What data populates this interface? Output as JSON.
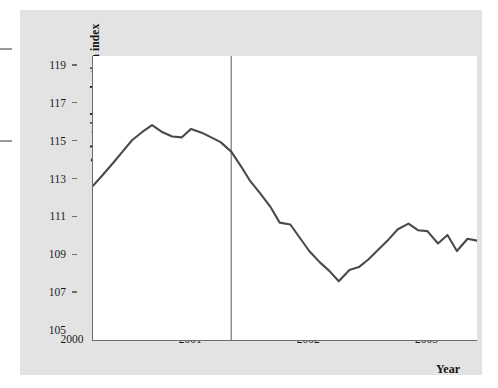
{
  "figure": {
    "background_color": "#e3e3e3",
    "plot_background_color": "#ffffff",
    "axis_color": "#6d6d6d",
    "line_color": "#4a4a4a",
    "marker_line_color": "#808080"
  },
  "axes": {
    "y_title_main": "Industrial production index",
    "y_title_sub": "(1996 = 100)",
    "x_title": "Year"
  },
  "annotations": {
    "series_label": "INDUSTRIAL\nPRODUCTION\nINDEX"
  },
  "chart_data": {
    "type": "line",
    "title": "",
    "subtitle": "",
    "xlabel": "Year",
    "ylabel": "Industrial production index (1996 = 100)",
    "xlim": [
      2000.0,
      2003.25
    ],
    "ylim": [
      105,
      120
    ],
    "yticks": [
      105,
      107,
      109,
      111,
      113,
      115,
      117,
      119
    ],
    "xticks": [
      2000,
      2001,
      2002,
      2003
    ],
    "xticklabels": [
      "2000",
      "2001",
      "2002",
      "2003"
    ],
    "yticklabels": [
      "105",
      "107",
      "109",
      "111",
      "113",
      "115",
      "117",
      "119"
    ],
    "grid": false,
    "legend": "none",
    "series": [
      {
        "name": "INDUSTRIAL PRODUCTION INDEX",
        "color": "#4a4a4a",
        "x": [
          2000.0,
          2000.08,
          2000.17,
          2000.25,
          2000.33,
          2000.42,
          2000.5,
          2000.58,
          2000.67,
          2000.75,
          2000.83,
          2000.92,
          2001.0,
          2001.08,
          2001.17,
          2001.25,
          2001.33,
          2001.42,
          2001.5,
          2001.58,
          2001.67,
          2001.75,
          2001.83,
          2001.92,
          2002.0,
          2002.08,
          2002.17,
          2002.25,
          2002.33,
          2002.42,
          2002.5,
          2002.58,
          2002.67,
          2002.75,
          2002.83,
          2002.92,
          2003.0,
          2003.08,
          2003.17,
          2003.25
        ],
        "y": [
          113.15,
          113.7,
          114.35,
          114.95,
          115.55,
          116.0,
          116.35,
          116.0,
          115.75,
          115.7,
          116.15,
          115.95,
          115.7,
          115.45,
          114.95,
          114.2,
          113.4,
          112.7,
          112.05,
          111.2,
          111.1,
          110.4,
          109.7,
          109.1,
          108.65,
          108.1,
          108.7,
          108.85,
          109.25,
          109.8,
          110.3,
          110.85,
          111.15,
          110.8,
          110.75,
          110.1,
          110.55,
          109.7,
          110.35,
          110.25
        ]
      }
    ],
    "vertical_markers": [
      {
        "name": "recession-start-line",
        "x": 2001.17,
        "color": "#808080"
      }
    ]
  }
}
